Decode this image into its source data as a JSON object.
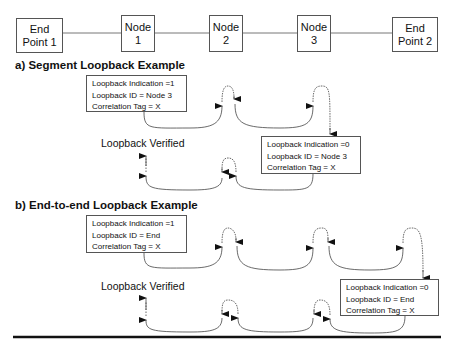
{
  "topology": {
    "nodes": [
      {
        "id": "ep1",
        "line1": "End",
        "line2": "Point 1"
      },
      {
        "id": "n1",
        "line1": "Node",
        "line2": "1"
      },
      {
        "id": "n2",
        "line1": "Node",
        "line2": "2"
      },
      {
        "id": "n3",
        "line1": "Node",
        "line2": "3"
      },
      {
        "id": "ep2",
        "line1": "End",
        "line2": "Point 2"
      }
    ]
  },
  "segment": {
    "heading": "a) Segment Loopback Example",
    "request": {
      "indication": "Loopback Indication =1",
      "id": "Loopback ID = Node 3",
      "tag": "Correlation Tag = X"
    },
    "reply": {
      "indication": "Loopback Indication =0",
      "id": "Loopback ID = Node 3",
      "tag": "Correlation Tag = X"
    },
    "verified": "Loopback Verified"
  },
  "endtoend": {
    "heading": "b) End-to-end Loopback Example",
    "request": {
      "indication": "Loopback Indication =1",
      "id": "Loopback ID = End",
      "tag": "Correlation Tag = X"
    },
    "reply": {
      "indication": "Loopback Indication =0",
      "id": "Loopback ID = End",
      "tag": "Correlation Tag = X"
    },
    "verified": "Loopback Verified"
  }
}
